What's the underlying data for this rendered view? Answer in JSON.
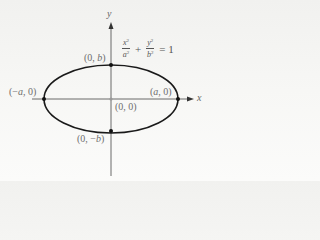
{
  "diagram": {
    "equation": {
      "term1": {
        "numerator": "x",
        "numerator_exp": "2",
        "denominator": "a",
        "denominator_exp": "2"
      },
      "plus": "+",
      "term2": {
        "numerator": "y",
        "numerator_exp": "2",
        "denominator": "b",
        "denominator_exp": "2"
      },
      "equals": "= 1"
    },
    "axes": {
      "x_label": "x",
      "y_label": "y"
    },
    "points": {
      "top": "(0, b)",
      "bottom": "(0, −b)",
      "left": "(−a, 0)",
      "right": "(a, 0)",
      "origin": "(0, 0)"
    },
    "colors": {
      "curve": "#1a1a1a",
      "axis": "#555555",
      "label": "#6e6e6e",
      "background": "#f4f4f2"
    }
  }
}
